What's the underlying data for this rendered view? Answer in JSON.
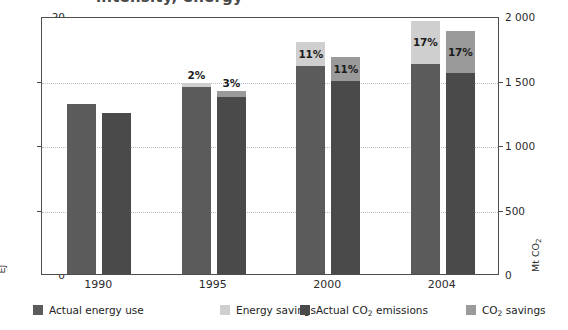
{
  "title_partial": "intensity, energy",
  "axes": {
    "left_title": "EJ",
    "right_title_main": "Mt CO",
    "right_title_sub": "2",
    "left_ticks": [
      "0",
      "5",
      "10",
      "15",
      "20"
    ],
    "right_ticks": [
      "0",
      "500",
      "1 000",
      "1 500",
      "2 000"
    ]
  },
  "legend": [
    {
      "label": "Actual energy use",
      "color": "#5b5b5b",
      "name": "legend-actual-energy-use"
    },
    {
      "label": "Energy savings",
      "color": "#cfcfcf",
      "name": "legend-energy-savings"
    },
    {
      "label": "Actual CO",
      "sub": "2",
      "label_tail": " emissions",
      "color": "#4a4a4a",
      "name": "legend-actual-co2-emissions"
    },
    {
      "label": "CO",
      "sub": "2",
      "label_tail": " savings",
      "color": "#9a9a9a",
      "name": "legend-co2-savings"
    }
  ],
  "chart_data": {
    "type": "bar",
    "title": "intensity, energy",
    "xlabel": "",
    "ylabel": "EJ",
    "y2label": "Mt CO2",
    "ylim": [
      0,
      20
    ],
    "y2lim": [
      0,
      2000
    ],
    "grid": true,
    "legend_position": "bottom",
    "categories": [
      "1990",
      "1995",
      "2000",
      "2004"
    ],
    "series": [
      {
        "name": "Actual energy use",
        "axis": "left",
        "unit": "EJ",
        "color": "#5b5b5b",
        "values": [
          13.2,
          14.5,
          16.1,
          16.3
        ]
      },
      {
        "name": "Energy savings",
        "axis": "left",
        "unit": "EJ",
        "color": "#cfcfcf",
        "values": [
          0.0,
          0.3,
          1.9,
          3.3
        ],
        "labels": [
          "",
          "2%",
          "11%",
          "17%"
        ]
      },
      {
        "name": "Actual CO2 emissions",
        "axis": "right",
        "unit": "Mt CO2",
        "color": "#4a4a4a",
        "values": [
          1250,
          1370,
          1500,
          1560
        ]
      },
      {
        "name": "CO2 savings",
        "axis": "right",
        "unit": "Mt CO2",
        "color": "#9a9a9a",
        "values": [
          0,
          45,
          185,
          325
        ],
        "labels": [
          "",
          "3%",
          "11%",
          "17%"
        ]
      }
    ]
  }
}
